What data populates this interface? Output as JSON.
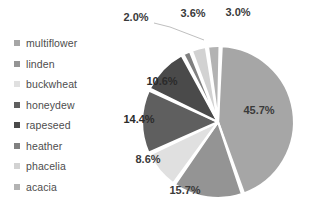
{
  "chart_data": {
    "type": "pie",
    "title": "",
    "legend_position": "left",
    "value_suffix": "%",
    "categories": [
      "multiflower",
      "linden",
      "buckwheat",
      "honeydew",
      "rapeseed",
      "heather",
      "phacelia",
      "acacia"
    ],
    "values": [
      45.7,
      15.7,
      8.6,
      14.4,
      10.6,
      2.0,
      3.6,
      3.0
    ],
    "labels": [
      "45.7%",
      "15.7%",
      "8.6%",
      "14.4%",
      "10.6%",
      "2.0%",
      "3.6%",
      "3.0%"
    ],
    "colors": [
      "#a6a6a6",
      "#949494",
      "#e0e0e0",
      "#5f5f5f",
      "#4a4a4a",
      "#808080",
      "#d2d2d2",
      "#b3b3b3"
    ],
    "label_placement": [
      "inside",
      "inside",
      "inside",
      "inside",
      "inside",
      "outside",
      "outside",
      "outside"
    ],
    "slice_gap_degrees": 1.6,
    "start_angle_degrees": -88
  },
  "legend": {
    "items": [
      {
        "label": "multiflower",
        "color": "#a6a6a6"
      },
      {
        "label": "linden",
        "color": "#949494"
      },
      {
        "label": "buckwheat",
        "color": "#e0e0e0"
      },
      {
        "label": "honeydew",
        "color": "#5f5f5f"
      },
      {
        "label": "rapeseed",
        "color": "#4a4a4a"
      },
      {
        "label": "heather",
        "color": "#808080"
      },
      {
        "label": "phacelia",
        "color": "#d2d2d2"
      },
      {
        "label": "acacia",
        "color": "#b3b3b3"
      }
    ]
  },
  "outer_labels": [
    {
      "text": "2.0%",
      "x": 28,
      "y": 18
    },
    {
      "text": "3.6%",
      "x": 85,
      "y": 14
    },
    {
      "text": "3.0%",
      "x": 130,
      "y": 13
    }
  ],
  "inner_labels": [
    {
      "text": "45.7%",
      "x": 151,
      "y": 111,
      "dark": false
    },
    {
      "text": "15.7%",
      "x": 77,
      "y": 191,
      "dark": false
    },
    {
      "text": "8.6%",
      "x": 40,
      "y": 160,
      "dark": false
    },
    {
      "text": "14.4%",
      "x": 31,
      "y": 120,
      "dark": true
    },
    {
      "text": "10.6%",
      "x": 54,
      "y": 82,
      "dark": true
    }
  ],
  "leader": {
    "from_x": 46,
    "from_y": 23,
    "mid_x": 62,
    "mid_y": 27,
    "to_x": 96,
    "to_y": 40
  }
}
